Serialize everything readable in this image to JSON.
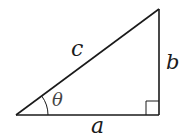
{
  "diagram": {
    "type": "right-triangle",
    "labels": {
      "hypotenuse": "c",
      "opposite": "b",
      "adjacent": "a",
      "angle": "θ"
    },
    "vertices": {
      "angle_vertex": [
        16,
        115
      ],
      "top_vertex": [
        159,
        9
      ],
      "right_angle_vertex": [
        159,
        115
      ]
    },
    "right_angle_marker": "square",
    "colors": {
      "line": "#1a1a1a",
      "background": "#ffffff"
    }
  }
}
